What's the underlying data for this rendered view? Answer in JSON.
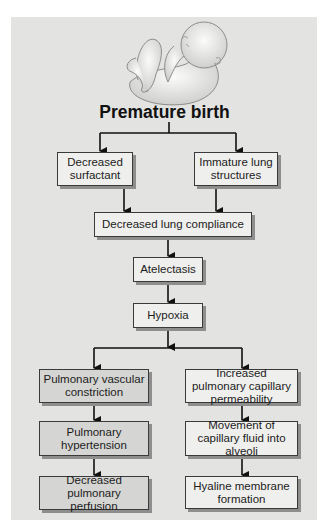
{
  "diagram": {
    "title": "Premature birth",
    "illustration": "curled-premature-infant",
    "nodes": {
      "decreased_surfactant": "Decreased surfactant",
      "immature_lung_structures": "Immature lung structures",
      "decreased_lung_compliance": "Decreased lung compliance",
      "atelectasis": "Atelectasis",
      "hypoxia": "Hypoxia",
      "pulmonary_vascular_constriction": "Pulmonary vascular constriction",
      "pulmonary_hypertension": "Pulmonary hypertension",
      "decreased_pulmonary_perfusion": "Decreased pulmonary perfusion",
      "increased_capillary_permeability": "Increased pulmonary capillary permeability",
      "movement_of_fluid": "Movement of capillary fluid into alveoli",
      "hyaline_membrane_formation": "Hyaline membrane formation"
    },
    "edges": [
      [
        "Premature birth",
        "Decreased surfactant"
      ],
      [
        "Premature birth",
        "Immature lung structures"
      ],
      [
        "Decreased surfactant",
        "Decreased lung compliance"
      ],
      [
        "Immature lung structures",
        "Decreased lung compliance"
      ],
      [
        "Decreased lung compliance",
        "Atelectasis"
      ],
      [
        "Atelectasis",
        "Hypoxia"
      ],
      [
        "Hypoxia",
        "Pulmonary vascular constriction"
      ],
      [
        "Hypoxia",
        "Increased pulmonary capillary permeability"
      ],
      [
        "Pulmonary vascular constriction",
        "Pulmonary hypertension"
      ],
      [
        "Pulmonary hypertension",
        "Decreased pulmonary perfusion"
      ],
      [
        "Increased pulmonary capillary permeability",
        "Movement of capillary fluid into alveoli"
      ],
      [
        "Movement of capillary fluid into alveoli",
        "Hyaline membrane formation"
      ]
    ],
    "colors": {
      "panel": "#e3e3e1",
      "box_light": "#efefed",
      "box_mid": "#d5d5d3",
      "line": "#111111"
    }
  }
}
